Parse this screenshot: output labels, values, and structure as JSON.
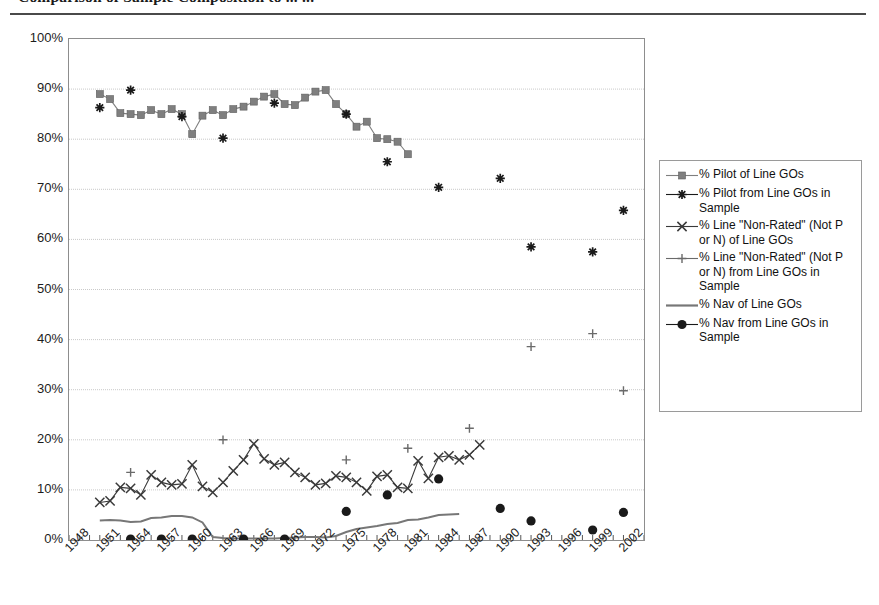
{
  "title": "Comparison of Sample Composition to ... ...",
  "legend": {
    "entries": [
      {
        "label": "% Pilot of Line GOs",
        "marker": "square",
        "color": "#7f7f7f",
        "line": true
      },
      {
        "label": "% Pilot from Line GOs in Sample",
        "marker": "asterisk",
        "color": "#1a1a1a",
        "line": true
      },
      {
        "label": "% Line \"Non-Rated\" (Not P or N) of Line GOs",
        "marker": "x",
        "color": "#3a3a3a",
        "line": true
      },
      {
        "label": "% Line \"Non-Rated\" (Not P or N) from Line GOs in Sample",
        "marker": "plus",
        "color": "#6a6a6a",
        "line": true
      },
      {
        "label": "% Nav of Line GOs",
        "marker": "none",
        "color": "#777777",
        "line": true
      },
      {
        "label": "% Nav from Line GOs in Sample",
        "marker": "circle",
        "color": "#1a1a1a",
        "line": true
      }
    ]
  },
  "chart_data": {
    "type": "line",
    "title": "Comparison of Sample Composition to ... ...",
    "xlabel": "",
    "ylabel": "",
    "xlim": [
      1948,
      2004
    ],
    "ylim": [
      0,
      100
    ],
    "ytick_labels": [
      "100%",
      "90%",
      "80%",
      "70%",
      "60%",
      "50%",
      "40%",
      "30%",
      "20%",
      "10%",
      "0%"
    ],
    "ytick_values": [
      100,
      90,
      80,
      70,
      60,
      50,
      40,
      30,
      20,
      10,
      0
    ],
    "xtick_labels": [
      "1948",
      "1951",
      "1954",
      "1957",
      "1960",
      "1963",
      "1966",
      "1969",
      "1972",
      "1975",
      "1978",
      "1981",
      "1984",
      "1987",
      "1990",
      "1993",
      "1996",
      "1999",
      "2002"
    ],
    "xtick_values": [
      1948,
      1951,
      1954,
      1957,
      1960,
      1963,
      1966,
      1969,
      1972,
      1975,
      1978,
      1981,
      1984,
      1987,
      1990,
      1993,
      1996,
      1999,
      2002
    ],
    "grid": true,
    "legend_position": "right",
    "series": [
      {
        "name": "% Pilot of Line GOs",
        "marker": "square",
        "color": "#7f7f7f",
        "line": true,
        "points": [
          [
            1951,
            89.0
          ],
          [
            1952,
            88.0
          ],
          [
            1953,
            85.2
          ],
          [
            1954,
            85.0
          ],
          [
            1955,
            84.8
          ],
          [
            1956,
            85.8
          ],
          [
            1957,
            85.0
          ],
          [
            1958,
            86.0
          ],
          [
            1959,
            85.0
          ],
          [
            1960,
            81.0
          ],
          [
            1961,
            84.7
          ],
          [
            1962,
            85.8
          ],
          [
            1963,
            84.8
          ],
          [
            1964,
            86.0
          ],
          [
            1965,
            86.5
          ],
          [
            1966,
            87.5
          ],
          [
            1967,
            88.5
          ],
          [
            1968,
            89.0
          ],
          [
            1969,
            87.0
          ],
          [
            1970,
            86.8
          ],
          [
            1971,
            88.3
          ],
          [
            1972,
            89.5
          ],
          [
            1973,
            89.8
          ],
          [
            1974,
            87.0
          ],
          [
            1975,
            85.0
          ],
          [
            1976,
            82.5
          ],
          [
            1977,
            83.5
          ],
          [
            1978,
            80.2
          ],
          [
            1979,
            80.0
          ],
          [
            1980,
            79.5
          ],
          [
            1981,
            77.0
          ]
        ]
      },
      {
        "name": "% Pilot from Line GOs in Sample",
        "marker": "asterisk",
        "color": "#1a1a1a",
        "line": false,
        "points": [
          [
            1951,
            86.3
          ],
          [
            1954,
            89.8
          ],
          [
            1959,
            84.5
          ],
          [
            1963,
            80.2
          ],
          [
            1968,
            87.2
          ],
          [
            1975,
            85.0
          ],
          [
            1979,
            75.5
          ],
          [
            1984,
            70.4
          ],
          [
            1990,
            72.2
          ],
          [
            1993,
            58.5
          ],
          [
            1999,
            57.5
          ],
          [
            2002,
            65.8
          ]
        ]
      },
      {
        "name": "% Line \"Non-Rated\" (Not P or N) of Line GOs",
        "marker": "x",
        "color": "#3a3a3a",
        "line": true,
        "points": [
          [
            1951,
            7.5
          ],
          [
            1952,
            7.8
          ],
          [
            1953,
            10.5
          ],
          [
            1954,
            10.3
          ],
          [
            1955,
            9.0
          ],
          [
            1956,
            13.0
          ],
          [
            1957,
            11.5
          ],
          [
            1958,
            11.0
          ],
          [
            1959,
            11.2
          ],
          [
            1960,
            15.0
          ],
          [
            1961,
            10.7
          ],
          [
            1962,
            9.5
          ],
          [
            1963,
            11.5
          ],
          [
            1964,
            13.8
          ],
          [
            1965,
            16.0
          ],
          [
            1966,
            19.2
          ],
          [
            1967,
            16.2
          ],
          [
            1968,
            15.0
          ],
          [
            1969,
            15.5
          ],
          [
            1970,
            13.5
          ],
          [
            1971,
            12.5
          ],
          [
            1972,
            11.0
          ],
          [
            1973,
            11.3
          ],
          [
            1974,
            12.8
          ],
          [
            1975,
            12.5
          ],
          [
            1976,
            11.5
          ],
          [
            1977,
            9.8
          ],
          [
            1978,
            12.7
          ],
          [
            1979,
            13.0
          ],
          [
            1980,
            10.5
          ],
          [
            1981,
            10.3
          ],
          [
            1982,
            15.8
          ],
          [
            1983,
            12.3
          ],
          [
            1984,
            16.5
          ],
          [
            1985,
            16.8
          ],
          [
            1986,
            16.0
          ],
          [
            1987,
            17.0
          ],
          [
            1988,
            19.0
          ]
        ]
      },
      {
        "name": "% Line \"Non-Rated\" (Not P or N) from Line GOs in Sample",
        "marker": "plus",
        "color": "#6a6a6a",
        "line": false,
        "points": [
          [
            1954,
            13.5
          ],
          [
            1963,
            20.0
          ],
          [
            1975,
            16.0
          ],
          [
            1981,
            18.3
          ],
          [
            1987,
            22.3
          ],
          [
            1993,
            38.6
          ],
          [
            1999,
            41.2
          ],
          [
            2002,
            29.8
          ]
        ]
      },
      {
        "name": "% Nav of Line GOs",
        "marker": "none",
        "color": "#777777",
        "line": true,
        "points": [
          [
            1951,
            3.9
          ],
          [
            1952,
            4.0
          ],
          [
            1953,
            3.9
          ],
          [
            1954,
            3.6
          ],
          [
            1955,
            3.7
          ],
          [
            1956,
            4.4
          ],
          [
            1957,
            4.5
          ],
          [
            1958,
            4.8
          ],
          [
            1959,
            4.8
          ],
          [
            1960,
            4.5
          ],
          [
            1961,
            3.5
          ],
          [
            1962,
            0.6
          ],
          [
            1963,
            0.4
          ],
          [
            1964,
            0.3
          ],
          [
            1965,
            0.3
          ],
          [
            1966,
            0.3
          ],
          [
            1967,
            0.3
          ],
          [
            1968,
            0.3
          ],
          [
            1969,
            0.4
          ],
          [
            1970,
            0.5
          ],
          [
            1971,
            0.6
          ],
          [
            1972,
            0.6
          ],
          [
            1973,
            0.5
          ],
          [
            1974,
            0.8
          ],
          [
            1975,
            1.6
          ],
          [
            1976,
            2.2
          ],
          [
            1977,
            2.5
          ],
          [
            1978,
            2.8
          ],
          [
            1979,
            3.2
          ],
          [
            1980,
            3.4
          ],
          [
            1981,
            4.0
          ],
          [
            1982,
            4.1
          ],
          [
            1983,
            4.5
          ],
          [
            1984,
            5.0
          ],
          [
            1985,
            5.1
          ],
          [
            1986,
            5.2
          ]
        ]
      },
      {
        "name": "% Nav from Line GOs in Sample",
        "marker": "circle",
        "color": "#1a1a1a",
        "line": false,
        "points": [
          [
            1954,
            0.2
          ],
          [
            1957,
            0.2
          ],
          [
            1960,
            0.2
          ],
          [
            1965,
            0.2
          ],
          [
            1969,
            0.2
          ],
          [
            1975,
            5.7
          ],
          [
            1979,
            9.0
          ],
          [
            1984,
            12.2
          ],
          [
            1990,
            6.3
          ],
          [
            1993,
            3.8
          ],
          [
            1999,
            2.0
          ],
          [
            2002,
            5.5
          ]
        ]
      }
    ]
  }
}
